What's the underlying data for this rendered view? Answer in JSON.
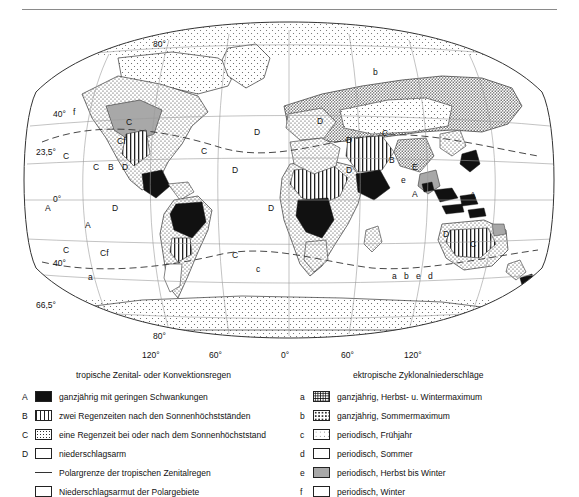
{
  "map": {
    "title": "",
    "graticule_labels": [
      {
        "text": "80°",
        "x": 131,
        "y": 31
      },
      {
        "text": "40°",
        "x": 31,
        "y": 101
      },
      {
        "text": "23,5°",
        "x": 22,
        "y": 139
      },
      {
        "text": "0°",
        "x": 31,
        "y": 186
      },
      {
        "text": "40°",
        "x": 31,
        "y": 250
      },
      {
        "text": "66,5°",
        "x": 22,
        "y": 292
      },
      {
        "text": "80°",
        "x": 131,
        "y": 323
      },
      {
        "text": "120°",
        "x": 126,
        "y": 338
      },
      {
        "text": "60°",
        "x": 191,
        "y": 338
      },
      {
        "text": "0°",
        "x": 281,
        "y": 338
      },
      {
        "text": "60°",
        "x": 341,
        "y": 338
      },
      {
        "text": "120°",
        "x": 408,
        "y": 338
      }
    ],
    "zone_letters": [
      {
        "text": "f",
        "x": 73,
        "y": 100
      },
      {
        "text": "C",
        "x": 110,
        "y": 96
      },
      {
        "text": "C",
        "x": 63,
        "y": 143
      },
      {
        "text": "Cf",
        "x": 117,
        "y": 130
      },
      {
        "text": "C",
        "x": 93,
        "y": 155
      },
      {
        "text": "B",
        "x": 108,
        "y": 155
      },
      {
        "text": "D",
        "x": 122,
        "y": 155
      },
      {
        "text": "A",
        "x": 45,
        "y": 196
      },
      {
        "text": "D",
        "x": 112,
        "y": 196
      },
      {
        "text": "A",
        "x": 85,
        "y": 213
      },
      {
        "text": "C",
        "x": 63,
        "y": 238
      },
      {
        "text": "Cf",
        "x": 100,
        "y": 241
      },
      {
        "text": "a",
        "x": 88,
        "y": 266
      },
      {
        "text": "D",
        "x": 254,
        "y": 120
      },
      {
        "text": "C",
        "x": 201,
        "y": 139
      },
      {
        "text": "D",
        "x": 232,
        "y": 158
      },
      {
        "text": "D",
        "x": 268,
        "y": 196
      },
      {
        "text": "C",
        "x": 232,
        "y": 243
      },
      {
        "text": "c",
        "x": 256,
        "y": 257
      },
      {
        "text": "D",
        "x": 317,
        "y": 109
      },
      {
        "text": "b",
        "x": 373,
        "y": 60
      },
      {
        "text": "D",
        "x": 346,
        "y": 128
      },
      {
        "text": "C",
        "x": 382,
        "y": 121
      },
      {
        "text": "D",
        "x": 346,
        "y": 158
      },
      {
        "text": "B",
        "x": 389,
        "y": 148
      },
      {
        "text": "E",
        "x": 412,
        "y": 155
      },
      {
        "text": "e",
        "x": 401,
        "y": 168
      },
      {
        "text": "A",
        "x": 412,
        "y": 182
      },
      {
        "text": "A",
        "x": 470,
        "y": 183
      },
      {
        "text": "D",
        "x": 443,
        "y": 222
      },
      {
        "text": "C",
        "x": 470,
        "y": 232
      },
      {
        "text": "a",
        "x": 392,
        "y": 264
      },
      {
        "text": "b",
        "x": 404,
        "y": 264
      },
      {
        "text": "e",
        "x": 416,
        "y": 264
      },
      {
        "text": "d",
        "x": 428,
        "y": 264
      }
    ]
  },
  "captions": {
    "left": "tropische Zenital- oder Konvektionsregen",
    "right": "ektropische Zyklonalniederschläge"
  },
  "legend_left": {
    "items": [
      {
        "key": "A",
        "pattern": "solid-black",
        "label": "ganzjährig mit geringen Schwankungen"
      },
      {
        "key": "B",
        "pattern": "vertical-lines",
        "label": "zwei Regenzeiten nach den Sonnenhöchstständen"
      },
      {
        "key": "C",
        "pattern": "fine-dots",
        "label": "eine Regenzeit bei oder nach dem Sonnenhöchststand"
      },
      {
        "key": "D",
        "pattern": "blank",
        "label": "niederschlagsarm"
      },
      {
        "key": "",
        "pattern": "dashed-line",
        "label": "Polargrenze der tropischen Zenitalregen"
      },
      {
        "key": "",
        "pattern": "sparse-dots",
        "label": "Niederschlagsarmut der Polargebiete"
      }
    ]
  },
  "legend_right": {
    "items": [
      {
        "key": "a",
        "pattern": "dense-black-dots",
        "label": "ganzjährig, Herbst- u. Wintermaximum"
      },
      {
        "key": "b",
        "pattern": "medium-dots",
        "label": "ganzjährig, Sommermaximum"
      },
      {
        "key": "c",
        "pattern": "light-dots",
        "label": "periodisch, Frühjahr"
      },
      {
        "key": "d",
        "pattern": "blank",
        "label": "periodisch, Sommer"
      },
      {
        "key": "e",
        "pattern": "gray-fill",
        "label": "periodisch, Herbst bis Winter"
      },
      {
        "key": "f",
        "pattern": "white-outline",
        "label": "periodisch, Winter"
      }
    ]
  }
}
